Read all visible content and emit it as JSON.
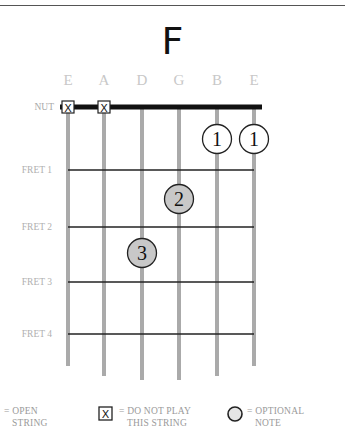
{
  "chord": {
    "name": "F",
    "strings": [
      "E",
      "A",
      "D",
      "G",
      "B",
      "E"
    ],
    "nut_label": "NUT",
    "fret_labels": [
      "FRET 1",
      "FRET 2",
      "FRET 3",
      "FRET 4"
    ],
    "muted_strings": [
      0,
      1
    ],
    "fingers": [
      {
        "string": 4,
        "fret": 1,
        "finger": "1",
        "style": "open-circle"
      },
      {
        "string": 5,
        "fret": 1,
        "finger": "1",
        "style": "open-circle"
      },
      {
        "string": 3,
        "fret": 2,
        "finger": "2",
        "style": "filled-circle"
      },
      {
        "string": 2,
        "fret": 3,
        "finger": "3",
        "style": "filled-circle"
      }
    ],
    "muted_symbol": "X"
  },
  "legend": {
    "open_string": {
      "line1": "= OPEN",
      "line2": "STRING"
    },
    "do_not_play": {
      "symbol": "X",
      "line1": "= DO NOT PLAY",
      "line2": "THIS STRING"
    },
    "optional_note": {
      "line1": "= OPTIONAL",
      "line2": "NOTE"
    }
  },
  "colors": {
    "string": "#aaaaaa",
    "fret": "#222222",
    "nut": "#111111",
    "label": "#b0b0b0",
    "string_name": "#c8c8c8",
    "filled_dot": "#c8c8c8",
    "dot_stroke": "#222222"
  }
}
